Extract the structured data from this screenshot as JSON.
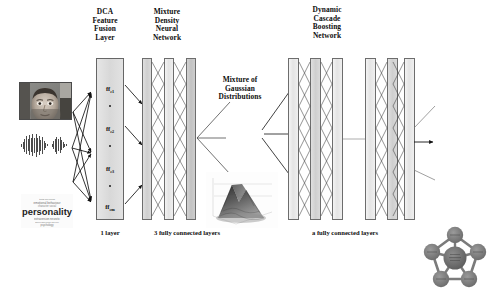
{
  "figure": {
    "background": "#ffffff",
    "ink": "#111111"
  },
  "headers": {
    "dca": "DCA\nFeature\nFusion\nLayer",
    "dca_lines": [
      "DCA",
      "Feature",
      "Fusion",
      "Layer"
    ],
    "mdnn_lines": [
      "Mixture",
      "Density",
      "Neural",
      "Network"
    ],
    "gaussian_lines": [
      "Mixture of",
      "Gaussian",
      "Distributions"
    ],
    "dcbn_lines": [
      "Dynamic",
      "Cascade",
      "Boosting",
      "Network"
    ]
  },
  "captions": {
    "dca": "1 layer",
    "mdnn": "3 fully connected layers",
    "dcbn": "a fully connected layers"
  },
  "inputs": [
    {
      "name": "face-image",
      "label": "face image",
      "type": "image"
    },
    {
      "name": "audio-waveform",
      "label": "audio waveform",
      "type": "waveform"
    },
    {
      "name": "text-wordcloud",
      "label": "personality",
      "type": "wordcloud"
    }
  ],
  "fusion_layer": {
    "nodes": [
      {
        "base": "ff",
        "sub": "c1"
      },
      {
        "base": "ff",
        "sub": "c2"
      },
      {
        "base": "ff",
        "sub": "c3"
      },
      {
        "base": "ff",
        "sub": "cm"
      }
    ],
    "ellipsis": "•"
  },
  "mdnn": {
    "columns": [
      {
        "name": "mdnn-layer-1",
        "shade": "mid"
      },
      {
        "name": "mdnn-layer-2",
        "shade": "light"
      },
      {
        "name": "mdnn-layer-3",
        "shade": "mid"
      }
    ]
  },
  "dcbn": {
    "group_a": [
      {
        "name": "dcbn-a-layer-1",
        "shade": "light"
      },
      {
        "name": "dcbn-a-layer-2",
        "shade": "mid"
      },
      {
        "name": "dcbn-a-layer-3",
        "shade": "light"
      }
    ],
    "group_b": [
      {
        "name": "dcbn-b-layer-1",
        "shade": "light"
      },
      {
        "name": "dcbn-b-layer-2",
        "shade": "mid"
      },
      {
        "name": "dcbn-b-layer-3",
        "shade": "light"
      }
    ],
    "connector": "—"
  },
  "graph": {
    "center_node": "",
    "outer_nodes": [
      "",
      "",
      "",
      "",
      ""
    ],
    "node_count": 6
  },
  "colors": {
    "slab_border": "#6d6d6d",
    "slab_light": "#efefef",
    "slab_mid": "#d4d4d4",
    "node_fill": "#7c7c7c",
    "arrow": "#111111"
  }
}
